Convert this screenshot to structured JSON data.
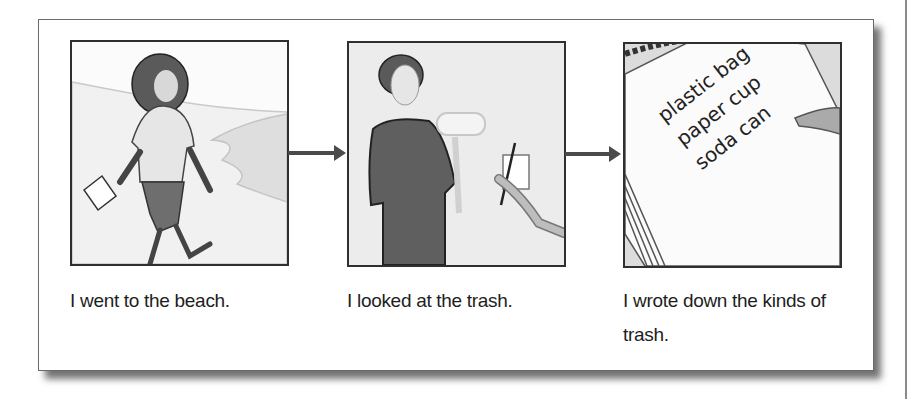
{
  "steps": [
    {
      "illustration": "woman-walking-on-beach",
      "caption": "I went to the beach."
    },
    {
      "illustration": "man-looking-at-trash-bottle",
      "caption": "I looked at the trash."
    },
    {
      "illustration": "notebook-trash-list",
      "caption": "I wrote down the kinds of trash.",
      "notebook_items": [
        "plastic bag",
        "paper cup",
        "soda can"
      ]
    }
  ],
  "arrows": [
    "arrow-right-icon",
    "arrow-right-icon"
  ],
  "colors": {
    "border": "#2f2f2f",
    "arrow": "#4b4b4b",
    "text": "#1e1e1e"
  }
}
